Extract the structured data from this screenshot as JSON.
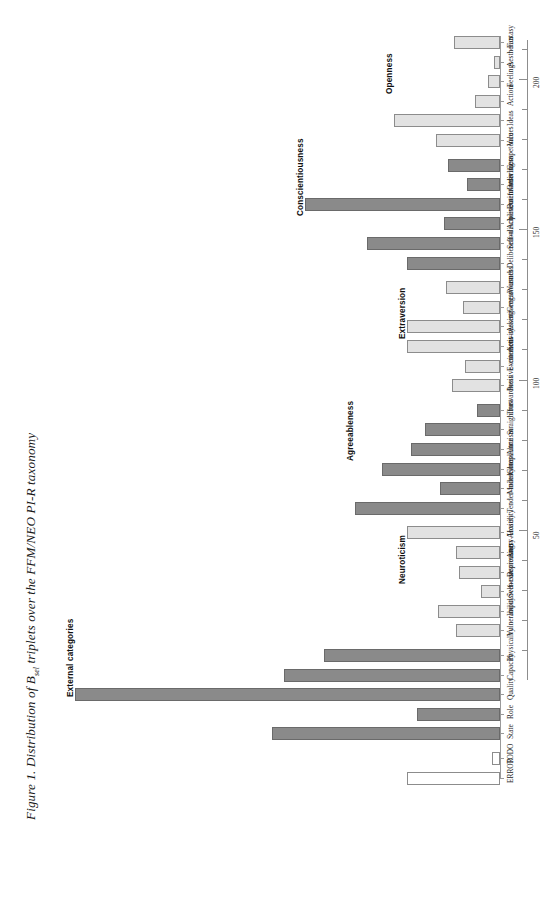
{
  "figure": {
    "caption_prefix": "Figure 1. Distribution of B",
    "caption_sub": "sel",
    "caption_suffix": " triplets over the FFM/NEO PI-R taxonomy",
    "caption_full": "Figure 1. Distribution of B sel triplets over the FFM/NEO PI-R taxonomy"
  },
  "chart_data": {
    "type": "bar",
    "orientation": "vertical-bars-rotated-90",
    "xlabel": "",
    "ylabel": "",
    "ylim": [
      0,
      215
    ],
    "grid": false,
    "legend": null,
    "yticks_major": [
      50,
      100,
      150,
      200
    ],
    "yticks_major_labels": [
      "50",
      "100",
      "150",
      "200"
    ],
    "yticks_minor": [
      10,
      20,
      30,
      40,
      60,
      70,
      80,
      90,
      110,
      120,
      130,
      140,
      160,
      170,
      180,
      190,
      200,
      210
    ],
    "categories": [
      "Fantasy",
      "Aesthetics",
      "Feelings",
      "Actions",
      "Ideas",
      "Values",
      "Competence",
      "Orderliness",
      "Dutifulness",
      "Achievement–striving",
      "Self–discipline",
      "Deliberation",
      "Warmth",
      "Gregariousness",
      "Assertiveness",
      "Activity",
      "Excitement–seeking",
      "Positive–emotions",
      "Trust",
      "Straightforwardness",
      "Altruism",
      "Compliance",
      "Modesty",
      "Tender–mindedness",
      "Anxiety",
      "Angry–Hostility",
      "Depression",
      "Self–consciousness",
      "Impulsiveness",
      "Vulnerability",
      "Physicality",
      "Capacity",
      "Quality",
      "Role",
      "State",
      "TODO",
      "ERROR"
    ],
    "values": [
      22,
      3,
      6,
      12,
      51,
      31,
      25,
      16,
      94,
      27,
      64,
      45,
      26,
      18,
      45,
      45,
      17,
      23,
      11,
      36,
      43,
      57,
      29,
      70,
      45,
      21,
      20,
      9,
      30,
      21,
      85,
      104,
      205,
      40,
      110,
      4,
      45
    ],
    "bar_styles": [
      "facet",
      "facet",
      "facet",
      "facet",
      "facet",
      "facet",
      "domain",
      "domain",
      "domain",
      "domain",
      "domain",
      "domain",
      "facet",
      "facet",
      "facet",
      "facet",
      "facet",
      "facet",
      "domain",
      "domain",
      "domain",
      "domain",
      "domain",
      "domain",
      "facet",
      "facet",
      "facet",
      "facet",
      "facet",
      "facet",
      "domain",
      "domain",
      "domain",
      "domain",
      "domain",
      "outline",
      "outline"
    ],
    "groups": [
      {
        "label": "Openness",
        "first_index": 0,
        "last_index": 5
      },
      {
        "label": "Conscientiousness",
        "first_index": 6,
        "last_index": 11
      },
      {
        "label": "Extraversion",
        "first_index": 12,
        "last_index": 17
      },
      {
        "label": "Agreeableness",
        "first_index": 18,
        "last_index": 23
      },
      {
        "label": "Neuroticism",
        "first_index": 24,
        "last_index": 29
      },
      {
        "label": "External categories",
        "first_index": 30,
        "last_index": 34
      }
    ],
    "colors": {
      "facet_fill": "#e2e2e2",
      "domain_fill": "#8a8a8a",
      "outline_fill": "#ffffff",
      "bar_stroke": "#6e6e6e",
      "axis": "#8d8d8d",
      "text": "#1d1d1d"
    }
  }
}
